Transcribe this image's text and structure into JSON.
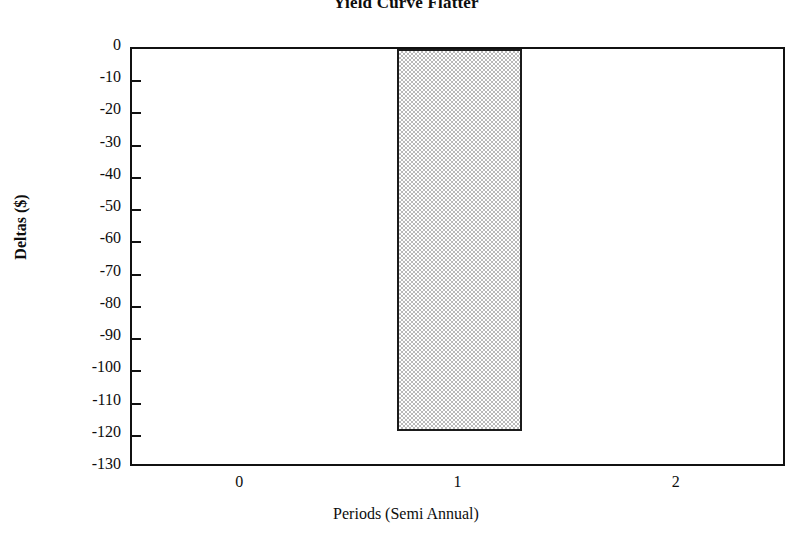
{
  "chart_data": {
    "type": "bar",
    "title": "Yield Curve Flatter",
    "xlabel": "Periods (Semi Annual)",
    "ylabel": "Deltas ($)",
    "categories": [
      "0",
      "1",
      "2"
    ],
    "x": [
      0,
      1,
      2
    ],
    "values": [
      0,
      -118.5,
      0
    ],
    "series": [
      {
        "name": "Deltas",
        "values": [
          0,
          -118.5,
          0
        ]
      }
    ],
    "bars": [
      {
        "category": "1",
        "x": 1,
        "value": -118.5
      }
    ],
    "xlim": [
      -0.5,
      2.5
    ],
    "ylim": [
      -130,
      0
    ],
    "ytick_step": 10,
    "yticks": [
      0,
      -10,
      -20,
      -30,
      -40,
      -50,
      -60,
      -70,
      -80,
      -90,
      -100,
      -110,
      -120,
      -130
    ],
    "ytick_labels": [
      "0",
      "-10",
      "-20",
      "-30",
      "-40",
      "-50",
      "-60",
      "-70",
      "-80",
      "-90",
      "-100",
      "-110",
      "-120",
      "-130"
    ],
    "xticks": [
      0,
      1,
      2
    ],
    "xtick_labels": [
      "0",
      "1",
      "2"
    ],
    "grid": false,
    "legend": null,
    "bar_fill": "#b9b9b9",
    "bar_edge": "#1b1b1b",
    "frame_color": "#111111",
    "background": "#ffffff"
  },
  "figure": {
    "title": "Yield Curve Flatter",
    "x_axis_title": "Periods (Semi Annual)",
    "y_axis_title": "Deltas ($)"
  }
}
